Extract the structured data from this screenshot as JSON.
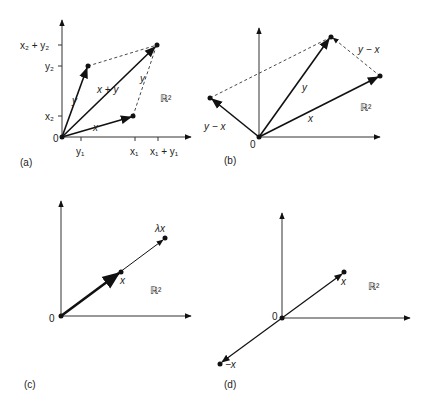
{
  "panels": {
    "a": {
      "caption": "(a)",
      "space": "ℝ²",
      "origin": "0",
      "vectors": {
        "x": "x",
        "y": "y",
        "sum": "x + y",
        "y_translated": "y"
      },
      "xticks": [
        "y₁",
        "x₁",
        "x₁ + y₁"
      ],
      "yticks": [
        "x₂ + y₂",
        "y₂",
        "x₂"
      ]
    },
    "b": {
      "caption": "(b)",
      "space": "ℝ²",
      "origin": "0",
      "vectors": {
        "x": "x",
        "y": "y",
        "diff": "y − x",
        "diff_translated": "y − x"
      }
    },
    "c": {
      "caption": "(c)",
      "space": "ℝ²",
      "origin": "0",
      "vectors": {
        "x": "x",
        "scaled": "λx"
      }
    },
    "d": {
      "caption": "(d)",
      "space": "ℝ²",
      "origin": "0",
      "vectors": {
        "x": "x",
        "neg": "−x"
      }
    }
  }
}
